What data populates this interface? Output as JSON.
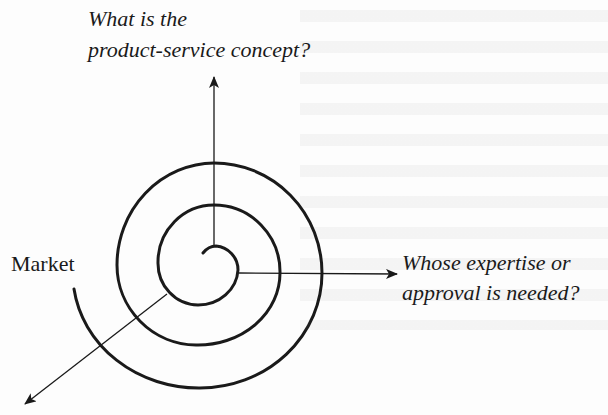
{
  "diagram": {
    "type": "spiral",
    "top_question": {
      "line1": "What is the",
      "line2": "product-service concept?"
    },
    "right_question": {
      "line1": "Whose expertise or",
      "line2": "approval is needed?"
    },
    "left_label": "Market",
    "arrows": [
      {
        "direction": "up",
        "label_ref": "top_question"
      },
      {
        "direction": "right",
        "label_ref": "right_question"
      },
      {
        "direction": "down-left",
        "label_ref": null
      }
    ],
    "colors": {
      "ink": "#1a1a1a",
      "background": "#fdfdfd"
    }
  }
}
